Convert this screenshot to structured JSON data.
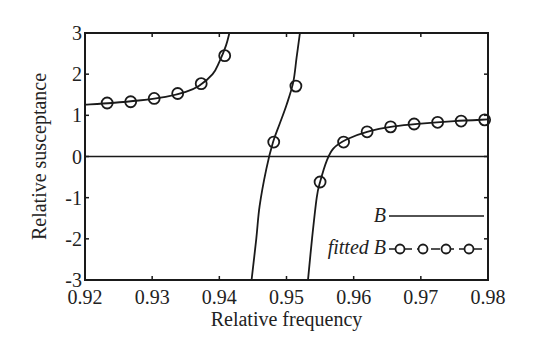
{
  "chart_data": {
    "type": "line",
    "title": "",
    "xlabel": "Relative frequency",
    "ylabel": "Relative susceptance",
    "xlim": [
      0.92,
      0.98
    ],
    "ylim": [
      -3,
      3
    ],
    "xticks": [
      0.92,
      0.93,
      0.94,
      0.95,
      0.96,
      0.97,
      0.98
    ],
    "xtick_labels": [
      "0.92",
      "0.93",
      "0.94",
      "0.95",
      "0.96",
      "0.97",
      "0.98"
    ],
    "yticks": [
      -3,
      -2,
      -1,
      0,
      1,
      2,
      3
    ],
    "ytick_labels": [
      "-3",
      "-2",
      "-1",
      "0",
      "1",
      "2",
      "3"
    ],
    "grid": false,
    "zero_line": true,
    "legend_position": "lower right (inside)",
    "series": [
      {
        "name": "B",
        "style": "solid line",
        "branches": [
          {
            "x": [
              0.92,
              0.924,
              0.928,
              0.932,
              0.935,
              0.937,
              0.939,
              0.94,
              0.941,
              0.9415
            ],
            "y": [
              1.26,
              1.3,
              1.36,
              1.45,
              1.57,
              1.72,
              2.0,
              2.3,
              2.7,
              3.0
            ]
          },
          {
            "x": [
              0.9448,
              0.9455,
              0.946,
              0.947,
              0.948,
              0.949,
              0.95,
              0.951,
              0.9515,
              0.952
            ],
            "y": [
              -3.0,
              -2.0,
              -1.2,
              -0.3,
              0.35,
              0.8,
              1.25,
              1.8,
              2.4,
              3.0
            ]
          },
          {
            "x": [
              0.9532,
              0.9538,
              0.9545,
              0.955,
              0.956,
              0.957,
              0.959,
              0.962,
              0.966,
              0.97,
              0.975,
              0.98
            ],
            "y": [
              -3.0,
              -2.0,
              -1.0,
              -0.62,
              -0.1,
              0.2,
              0.42,
              0.6,
              0.73,
              0.8,
              0.86,
              0.9
            ]
          }
        ]
      },
      {
        "name": "fitted B",
        "style": "circle markers",
        "points": [
          {
            "x": 0.9233,
            "y": 1.3
          },
          {
            "x": 0.9268,
            "y": 1.33
          },
          {
            "x": 0.9303,
            "y": 1.41
          },
          {
            "x": 0.9338,
            "y": 1.53
          },
          {
            "x": 0.9373,
            "y": 1.77
          },
          {
            "x": 0.9408,
            "y": 2.45
          },
          {
            "x": 0.9481,
            "y": 0.35
          },
          {
            "x": 0.9514,
            "y": 1.71
          },
          {
            "x": 0.955,
            "y": -0.62
          },
          {
            "x": 0.9585,
            "y": 0.35
          },
          {
            "x": 0.962,
            "y": 0.6
          },
          {
            "x": 0.9655,
            "y": 0.72
          },
          {
            "x": 0.969,
            "y": 0.79
          },
          {
            "x": 0.9725,
            "y": 0.83
          },
          {
            "x": 0.976,
            "y": 0.86
          },
          {
            "x": 0.9795,
            "y": 0.89
          }
        ]
      }
    ],
    "annotations": []
  },
  "legend": {
    "items": [
      {
        "label": "B"
      },
      {
        "label": "fitted B"
      }
    ]
  },
  "colors": {
    "line": "#1a1a1a",
    "axis": "#1a1a1a",
    "background": "#ffffff"
  }
}
